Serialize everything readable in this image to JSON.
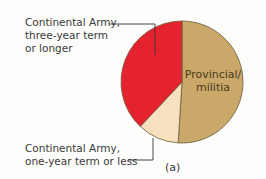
{
  "chart_data": {
    "type": "pie",
    "title": "",
    "caption": "(a)",
    "slices": [
      {
        "label": "Provincial/ militia",
        "value": 51,
        "color": "#c9a86a"
      },
      {
        "label": "Continental Army, one-year term or less",
        "value": 11,
        "color": "#f7e0bd"
      },
      {
        "label": "Continental Army, three-year term or longer",
        "value": 38,
        "color": "#e5232e"
      }
    ],
    "start_angle": "12 o'clock, clockwise",
    "legend": "callout labels"
  },
  "labels": {
    "three_year": [
      "Continental Army,",
      "three-year term",
      "or longer"
    ],
    "one_year": [
      "Continental Army,",
      "one-year term or less"
    ],
    "provincial": [
      "Provincial/",
      "militia"
    ],
    "caption": "(a)"
  }
}
